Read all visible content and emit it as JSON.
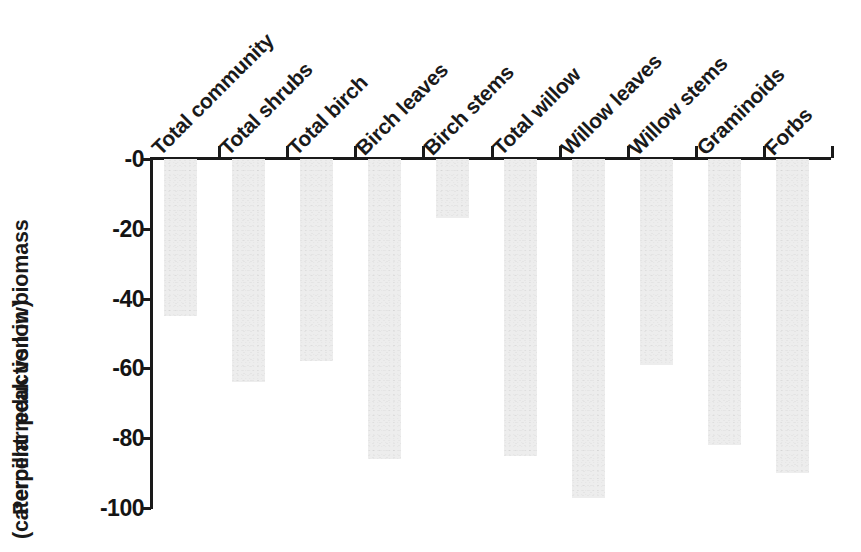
{
  "chart_data": {
    "type": "bar",
    "title": "",
    "subtitle": "",
    "xlabel": "",
    "ylabel": "Percent reduction in biomass (caterpillar peak vs low)",
    "ylabel_lines": [
      "Percent reduction in biomass",
      "(caterpillar peak vs low)"
    ],
    "categories": [
      "Total community",
      "Total shrubs",
      "Total birch",
      "Birch leaves",
      "Birch stems",
      "Total willow",
      "Willow leaves",
      "Willow stems",
      "Graminoids",
      "Forbs"
    ],
    "values": [
      -45,
      -64,
      -58,
      -86,
      -17,
      -85,
      -97,
      -59,
      -82,
      -90
    ],
    "ylim": [
      -100,
      0
    ],
    "ytick_values": [
      0,
      -20,
      -40,
      -60,
      -80,
      -100
    ],
    "ytick_labels": [
      "-0",
      "-20",
      "-40",
      "-60",
      "-80",
      "-100"
    ],
    "grid": false,
    "legend": null,
    "legend_position": "none",
    "bar_color": "#ededed",
    "axis_color": "#1a1a1a",
    "text_color": "#1a1a1a",
    "xlabel_rotation_deg": 45
  }
}
